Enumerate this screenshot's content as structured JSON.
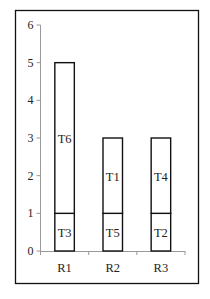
{
  "chart_data": {
    "type": "bar",
    "stacked": true,
    "title": "",
    "xlabel": "",
    "ylabel": "",
    "ylim": [
      0,
      6
    ],
    "yticks": [
      0,
      1,
      2,
      3,
      4,
      5,
      6
    ],
    "categories": [
      "R1",
      "R2",
      "R3"
    ],
    "grid": false,
    "legend": null,
    "series": [
      {
        "name": "bottom",
        "values": [
          1,
          1,
          1
        ],
        "labels": [
          "T3",
          "T5",
          "T2"
        ]
      },
      {
        "name": "top",
        "values": [
          4,
          2,
          2
        ],
        "labels": [
          "T6",
          "T1",
          "T4"
        ]
      }
    ],
    "colors": {
      "bar_fill": "#ffffff",
      "bar_stroke": "#111111",
      "axis": "#999999",
      "frame": "#111111"
    }
  }
}
